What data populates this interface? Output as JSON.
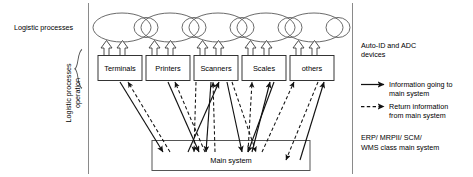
{
  "figure": {
    "left_labels": {
      "processes": "Logistic processes",
      "operation_line1": "Logistic processes",
      "operation_line2": "operation"
    },
    "process_chain": {
      "name": "logistic-process-chain",
      "ellipse_count": 6
    },
    "devices": [
      {
        "id": "terminals",
        "label": "Terminals"
      },
      {
        "id": "printers",
        "label": "Printers"
      },
      {
        "id": "scanners",
        "label": "Scanners"
      },
      {
        "id": "scales",
        "label": "Scales"
      },
      {
        "id": "others",
        "label": "others"
      }
    ],
    "main_system": {
      "label": "Main system"
    },
    "legend": {
      "devices_caption_line1": "Auto-ID and ADC",
      "devices_caption_line2": "devices",
      "items": [
        {
          "style": "solid",
          "line1": "Information going to",
          "line2": "main system"
        },
        {
          "style": "dashed",
          "line1": "Return information",
          "line2": "from main system"
        }
      ],
      "main_system_caption_line1": "ERP/ MRPII/ SCM/",
      "main_system_caption_line2": "WMS  class main system"
    },
    "colors": {
      "stroke": "#1a1a1a",
      "ellipse_stroke": "#4d4d4d",
      "box_stroke": "#333333",
      "background": "#ffffff"
    }
  }
}
